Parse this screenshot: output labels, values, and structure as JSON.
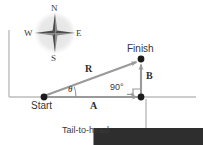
{
  "diagram": {
    "compass": {
      "name": "compass-rose",
      "north": "N",
      "east": "E",
      "south": "S",
      "west": "W"
    },
    "points": {
      "start": "Start",
      "finish": "Finish"
    },
    "vectors": {
      "resultant": "R",
      "horizontal": "A",
      "vertical": "B"
    },
    "angles": {
      "theta": "θ",
      "right_angle": "90°"
    },
    "annotation": {
      "tail_to_head": "Tail-to-head"
    },
    "colors": {
      "vector": "#9a9a9a",
      "axis": "#b0b0b0",
      "dot": "#1c1c1c",
      "text": "#2e2e2e",
      "compass_disc": "#ececec",
      "leader": "#a8a8a8"
    }
  }
}
